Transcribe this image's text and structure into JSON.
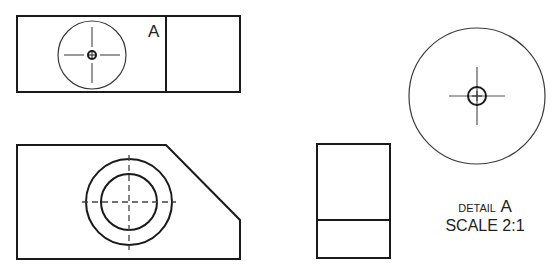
{
  "drawing": {
    "type": "orthographic engineering drawing with detail view",
    "views": [
      {
        "name": "top-view",
        "shape": "rectangle",
        "x": 16,
        "y": 16,
        "w": 224,
        "h": 76,
        "divider_x": 166
      },
      {
        "name": "front-view",
        "shape": "polygon with chamfered corner"
      },
      {
        "name": "right-side-view",
        "shape": "rectangle",
        "x": 317,
        "y": 144,
        "w": 73,
        "h": 114,
        "divider_y": 220
      },
      {
        "name": "detail-view",
        "shape": "circle",
        "cx": 477,
        "cy": 96,
        "r": 68
      }
    ],
    "labels": {
      "detail_marker": "A",
      "detail_prefix": "DETAIL",
      "detail_letter": "A",
      "scale": "SCALE 2:1"
    },
    "colors": {
      "line": "#1a1a1a",
      "background": "#ffffff"
    }
  }
}
